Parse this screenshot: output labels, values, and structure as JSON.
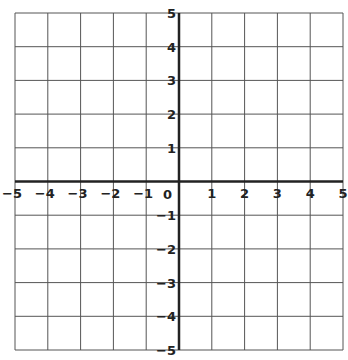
{
  "graph": {
    "title": "",
    "x_range": [
      -5,
      5
    ],
    "y_range": [
      -5,
      5
    ],
    "grid_step": 1,
    "origin_label": "0",
    "x_tick_labels": [
      "-5",
      "-4",
      "-3",
      "-2",
      "-1",
      "1",
      "2",
      "3",
      "4",
      "5"
    ],
    "y_tick_labels": [
      "5",
      "4",
      "3",
      "2",
      "1",
      "-1",
      "-2",
      "-3",
      "-4",
      "-5"
    ],
    "colors": {
      "background": "#ffffff",
      "grid_line": "#555555",
      "axis_line": "#222222",
      "label": "#222222"
    },
    "pixel_layout": {
      "left": 15,
      "right": 343,
      "top": 13,
      "bottom": 350,
      "origin_x": 181,
      "origin_y": 181
    }
  }
}
